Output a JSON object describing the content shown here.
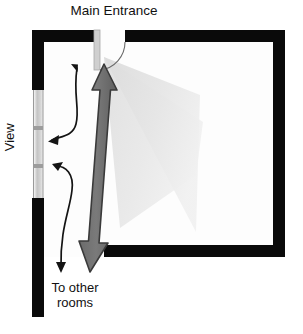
{
  "diagram": {
    "type": "architectural-floor-plan",
    "title": "Main Entrance",
    "background_color": "#ffffff"
  },
  "labels": {
    "main_entrance": "Main Entrance",
    "view": "View",
    "to_other_rooms_line1": "To other",
    "to_other_rooms_line2": "rooms"
  },
  "elements": {
    "wall": {
      "name": "wall",
      "color": "#0a0a0a",
      "thickness_px": 12
    },
    "room_floor": {
      "name": "room-floor",
      "color": "#fdfdfd"
    },
    "window": {
      "name": "window",
      "color": "#c9c9c9",
      "frame_color": "#8e8e8e",
      "mullion_count": 2
    },
    "door": {
      "name": "door-opening",
      "leaf_color": "#cfcfcf",
      "swing_arc_color": "#555555"
    },
    "view_cone": {
      "name": "view-cone",
      "color": "#e2e2e2",
      "description": "shaded sight-line fan from entrance into room"
    },
    "circulation_arrow": {
      "name": "main-circulation-arrow",
      "color": "#6e6e6e",
      "outline_color": "#3b3b3b",
      "style": "double-headed"
    },
    "curved_arrows": {
      "name": "secondary-circulation-arrows",
      "color": "#141414",
      "count": 2,
      "style": "double-headed-curved"
    }
  }
}
